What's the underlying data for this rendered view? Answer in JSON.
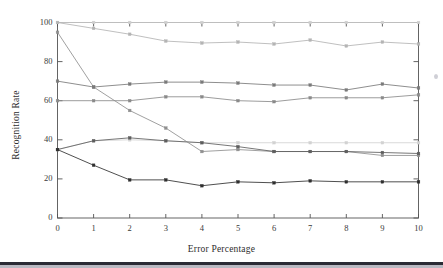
{
  "figure": {
    "background": "#ffffff",
    "plot_border_color": "#4a4a4a"
  },
  "axes": {
    "y_title": "Recognition Rate",
    "x_title": "Error Percentage",
    "y_ticks": [
      "0",
      "20",
      "40",
      "60",
      "80",
      "100"
    ],
    "x_ticks": [
      "0",
      "1",
      "2",
      "3",
      "4",
      "5",
      "6",
      "7",
      "8",
      "9",
      "10"
    ]
  },
  "chart_data": {
    "type": "line",
    "title": "",
    "xlabel": "Error Percentage",
    "ylabel": "Recognition Rate",
    "xlim": [
      0,
      10
    ],
    "ylim": [
      0,
      100
    ],
    "xticks": [
      0,
      1,
      2,
      3,
      4,
      5,
      6,
      7,
      8,
      9,
      10
    ],
    "yticks": [
      0,
      20,
      40,
      60,
      80,
      100
    ],
    "grid": false,
    "legend": "none",
    "marker": "square",
    "x": [
      0,
      1,
      2,
      3,
      4,
      5,
      6,
      7,
      8,
      9,
      10
    ],
    "series": [
      {
        "name": "series-1-top-flat",
        "color": "#cfcfcf",
        "values": [
          100,
          100,
          100,
          100,
          100,
          100,
          100,
          100,
          100,
          100,
          100
        ]
      },
      {
        "name": "series-2-upper-decline",
        "color": "#b4b4b4",
        "values": [
          100,
          97,
          94,
          90.5,
          89.5,
          90,
          89,
          91,
          88,
          90,
          89
        ]
      },
      {
        "name": "series-3-steep-decline",
        "color": "#8f8f8f",
        "values": [
          95,
          67,
          55,
          46,
          34,
          35,
          34,
          34,
          34,
          32,
          32
        ]
      },
      {
        "name": "series-4-mid-high",
        "color": "#7a7a7a",
        "values": [
          70,
          67,
          68.5,
          69.5,
          69.5,
          69,
          68,
          68,
          65.5,
          68.5,
          66.5
        ]
      },
      {
        "name": "series-5-mid-low",
        "color": "#8a8a8a",
        "values": [
          60,
          60,
          60,
          62,
          62,
          60,
          59.5,
          61.5,
          61.5,
          61.5,
          63
        ]
      },
      {
        "name": "series-6-light-flat",
        "color": "#d2d2d2",
        "values": [
          35,
          39.5,
          40,
          39.5,
          38.5,
          38.5,
          38.5,
          38.5,
          38.5,
          38.5,
          38.5
        ]
      },
      {
        "name": "series-7-mid-dark-decline",
        "color": "#5e5e5e",
        "values": [
          35,
          39.5,
          41,
          39.5,
          38.5,
          36.5,
          34,
          34,
          34,
          33.5,
          33
        ]
      },
      {
        "name": "series-8-low-dark",
        "color": "#2f2f2f",
        "values": [
          35,
          27,
          19.5,
          19.5,
          16.5,
          18.5,
          18,
          19,
          18.5,
          18.5,
          18.5
        ]
      }
    ]
  }
}
